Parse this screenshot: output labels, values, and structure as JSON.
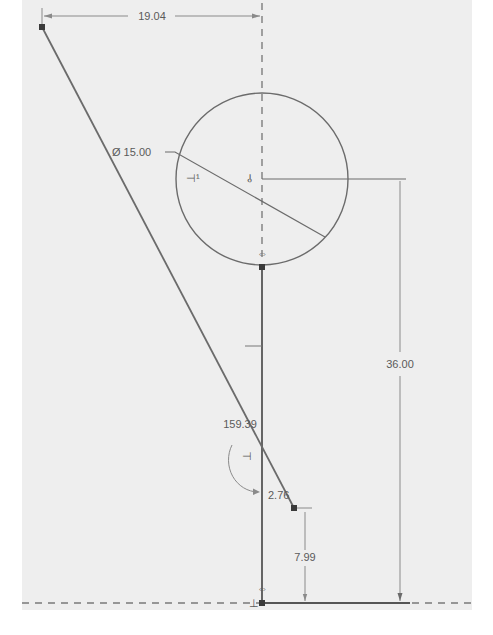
{
  "sketch": {
    "colors": {
      "background": "#ffffff",
      "canvas": "#eeeeee",
      "geometry": "#6b6b6b",
      "dimension": "#8a8a8a",
      "text": "#5a5a5a",
      "point": "#3a3a3a"
    },
    "dimensions": {
      "horizontal_top": "19.04",
      "diameter": "Ø 15.00",
      "vertical_right": "36.00",
      "angle": "159.39",
      "small_offset": "2.76",
      "vertical_small": "7.99"
    },
    "constraint_icons": [
      {
        "name": "tangent-constraint-icon",
        "glyph": "⊣¹"
      },
      {
        "name": "coincident-constraint-icon",
        "glyph": "⫰"
      },
      {
        "name": "vertical-constraint-icon",
        "glyph": "⇔"
      },
      {
        "name": "perpendicular-constraint-icon",
        "glyph": "⊣"
      },
      {
        "name": "horizontal-constraint-icon",
        "glyph": "⇔"
      },
      {
        "name": "fix-constraint-icon",
        "glyph": "⊥"
      }
    ]
  }
}
